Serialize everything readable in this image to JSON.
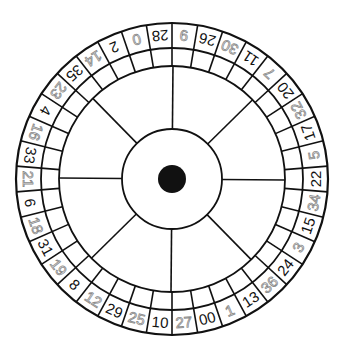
{
  "diagram": {
    "pocket_count": 38,
    "start_angle_deg_of_first": -14.21,
    "order_clockwise": [
      {
        "n": "0",
        "color": "red"
      },
      {
        "n": "28",
        "color": "black"
      },
      {
        "n": "9",
        "color": "red"
      },
      {
        "n": "26",
        "color": "black"
      },
      {
        "n": "30",
        "color": "red"
      },
      {
        "n": "11",
        "color": "black"
      },
      {
        "n": "7",
        "color": "red"
      },
      {
        "n": "20",
        "color": "black"
      },
      {
        "n": "32",
        "color": "red"
      },
      {
        "n": "17",
        "color": "black"
      },
      {
        "n": "5",
        "color": "red"
      },
      {
        "n": "22",
        "color": "black"
      },
      {
        "n": "34",
        "color": "red"
      },
      {
        "n": "15",
        "color": "black"
      },
      {
        "n": "3",
        "color": "red"
      },
      {
        "n": "24",
        "color": "black"
      },
      {
        "n": "36",
        "color": "red"
      },
      {
        "n": "13",
        "color": "black"
      },
      {
        "n": "1",
        "color": "red"
      },
      {
        "n": "00",
        "color": "black"
      },
      {
        "n": "27",
        "color": "red"
      },
      {
        "n": "10",
        "color": "black"
      },
      {
        "n": "25",
        "color": "red"
      },
      {
        "n": "29",
        "color": "black"
      },
      {
        "n": "12",
        "color": "red"
      },
      {
        "n": "8",
        "color": "black"
      },
      {
        "n": "19",
        "color": "red"
      },
      {
        "n": "31",
        "color": "black"
      },
      {
        "n": "18",
        "color": "red"
      },
      {
        "n": "6",
        "color": "black"
      },
      {
        "n": "21",
        "color": "red"
      },
      {
        "n": "33",
        "color": "black"
      },
      {
        "n": "16",
        "color": "red"
      },
      {
        "n": "4",
        "color": "black"
      },
      {
        "n": "23",
        "color": "red"
      },
      {
        "n": "35",
        "color": "black"
      },
      {
        "n": "14",
        "color": "red"
      },
      {
        "n": "2",
        "color": "black"
      }
    ],
    "spoke_count": 8,
    "colors": {
      "line": "#111111",
      "black_number": "#111111",
      "red_number_outline": "#8a8a8a",
      "center_dot": "#111111"
    }
  }
}
